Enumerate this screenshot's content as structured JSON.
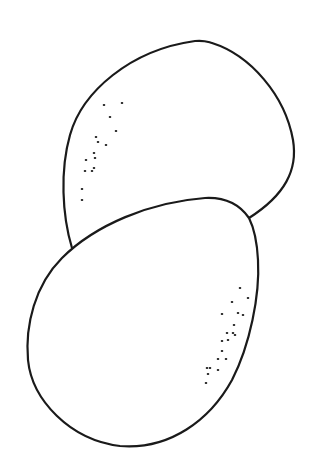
{
  "drawing": {
    "description": "Line drawing of two egg shapes, one overlapping the other, with stipple shading dots",
    "background": "#ffffff",
    "ink_color": "#1a1a1a",
    "eggs": [
      {
        "name": "upper-egg",
        "path": "M 72 248 C 62 215, 60 170, 70 135 C 82 92, 130 50, 195 41 C 205 40, 208 42, 212 43 C 250 55, 285 95, 293 140 C 298 170, 285 195, 249 218",
        "stipple": [
          [
            104,
            105
          ],
          [
            122,
            103
          ],
          [
            110,
            117
          ],
          [
            116,
            131
          ],
          [
            96,
            137
          ],
          [
            98,
            142
          ],
          [
            106,
            145
          ],
          [
            94,
            153
          ],
          [
            95,
            158
          ],
          [
            86,
            160
          ],
          [
            85,
            171
          ],
          [
            92,
            171
          ],
          [
            94,
            168
          ],
          [
            82,
            189
          ],
          [
            82,
            200
          ]
        ]
      },
      {
        "name": "lower-egg",
        "path": "M 249 218 C 240 205, 225 197, 205 198 C 150 202, 95 225, 62 258 C 35 285, 25 325, 28 360 C 32 400, 70 440, 120 446 C 170 450, 210 420, 232 380 C 250 345, 260 295, 258 260 C 257 240, 254 228, 249 218 Z",
        "stipple": [
          [
            240,
            288
          ],
          [
            248,
            298
          ],
          [
            232,
            302
          ],
          [
            222,
            314
          ],
          [
            238,
            313
          ],
          [
            243,
            315
          ],
          [
            234,
            325
          ],
          [
            233,
            333
          ],
          [
            235,
            335
          ],
          [
            227,
            333
          ],
          [
            228,
            340
          ],
          [
            222,
            341
          ],
          [
            222,
            351
          ],
          [
            218,
            359
          ],
          [
            226,
            359
          ],
          [
            210,
            368
          ],
          [
            218,
            370
          ],
          [
            206,
            383
          ],
          [
            207,
            368
          ],
          [
            208,
            374
          ]
        ]
      }
    ]
  }
}
